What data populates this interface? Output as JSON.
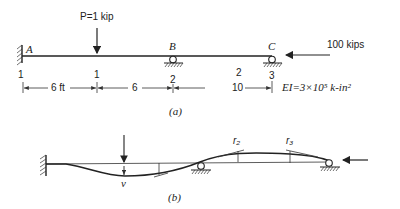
{
  "figure_a": {
    "caption": "(a)",
    "load_label": "P=1 kip",
    "axial_load_label": "100 kips",
    "stiffness_label": "EI=3×10⁵ k-in²",
    "points": [
      "A",
      "B",
      "C"
    ],
    "node_numbers": [
      "1",
      "1",
      "2",
      "3"
    ],
    "element_labels": [
      "2"
    ],
    "dimensions": [
      "6 ft",
      "6",
      "10"
    ]
  },
  "figure_b": {
    "caption": "(b)",
    "displacement_label": "v",
    "rotation_labels": [
      "r₂",
      "r₃"
    ]
  }
}
